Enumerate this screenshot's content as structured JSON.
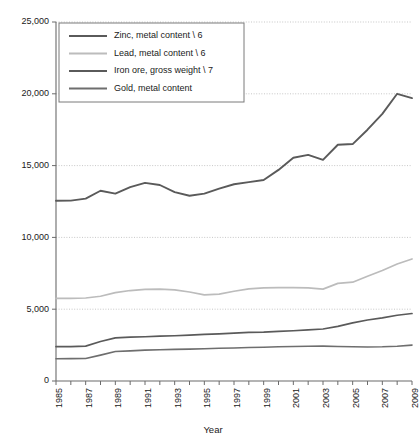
{
  "chart_data": {
    "type": "line",
    "title": "",
    "xlabel": "Year",
    "ylabel": "",
    "xlim": [
      1985,
      2009
    ],
    "ylim": [
      0,
      25000
    ],
    "grid": true,
    "legend_position": "top-left",
    "y_ticks": [
      0,
      5000,
      10000,
      15000,
      20000,
      25000
    ],
    "y_tick_labels": [
      "0",
      "5,000",
      "10,000",
      "15,000",
      "20,000",
      "25,000"
    ],
    "x_ticks": [
      1985,
      1986,
      1987,
      1988,
      1989,
      1990,
      1991,
      1992,
      1993,
      1994,
      1995,
      1996,
      1997,
      1998,
      1999,
      2000,
      2001,
      2002,
      2003,
      2004,
      2005,
      2006,
      2007,
      2008,
      2009
    ],
    "x_tick_labels": [
      "1985",
      "",
      "1987",
      "",
      "1989",
      "",
      "1991",
      "",
      "1993",
      "",
      "1995",
      "",
      "1997",
      "",
      "1999",
      "",
      "2001",
      "",
      "2003",
      "",
      "2005",
      "",
      "2007",
      "",
      "2009"
    ],
    "x": [
      1985,
      1986,
      1987,
      1988,
      1989,
      1990,
      1991,
      1992,
      1993,
      1994,
      1995,
      1996,
      1997,
      1998,
      1999,
      2000,
      2001,
      2002,
      2003,
      2004,
      2005,
      2006,
      2007,
      2008,
      2009
    ],
    "series": [
      {
        "name": "Zinc, metal content \\ 6",
        "color": "#5a5a5a",
        "width": 1.7,
        "values": [
          2400,
          2400,
          2430,
          2750,
          3000,
          3050,
          3080,
          3120,
          3150,
          3200,
          3250,
          3280,
          3330,
          3380,
          3400,
          3450,
          3500,
          3560,
          3620,
          3800,
          4050,
          4250,
          4400,
          4580,
          4700
        ]
      },
      {
        "name": "Lead, metal content \\ 6",
        "color": "#bcbcbc",
        "width": 1.7,
        "values": [
          5750,
          5750,
          5780,
          5900,
          6150,
          6300,
          6380,
          6400,
          6350,
          6200,
          6000,
          6050,
          6250,
          6420,
          6480,
          6500,
          6500,
          6480,
          6400,
          6800,
          6880,
          7300,
          7700,
          8150,
          8500
        ]
      },
      {
        "name": "Iron ore, gross weight \\ 7",
        "color": "#5a5a5a",
        "width": 1.9,
        "values": [
          12550,
          12560,
          12700,
          13250,
          13050,
          13500,
          13800,
          13650,
          13150,
          12900,
          13050,
          13400,
          13700,
          13850,
          14000,
          14700,
          15550,
          15750,
          15400,
          16450,
          16500,
          17500,
          18600,
          20000,
          19700
        ]
      },
      {
        "name": "Gold, metal content",
        "color": "#6e6e6e",
        "width": 1.6,
        "values": [
          1550,
          1560,
          1570,
          1800,
          2050,
          2100,
          2150,
          2180,
          2200,
          2220,
          2250,
          2280,
          2300,
          2330,
          2350,
          2380,
          2400,
          2420,
          2430,
          2400,
          2380,
          2370,
          2380,
          2420,
          2500
        ]
      }
    ]
  },
  "legend": {
    "entries": [
      {
        "label": "Zinc, metal content \\ 6"
      },
      {
        "label": "Lead, metal content \\ 6"
      },
      {
        "label": "Iron ore, gross weight \\ 7"
      },
      {
        "label": "Gold, metal content"
      }
    ]
  },
  "axes": {
    "x_title": "Year"
  }
}
